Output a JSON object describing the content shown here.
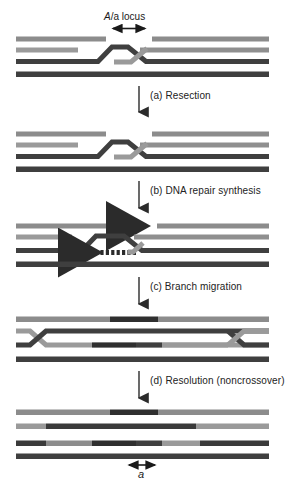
{
  "figure": {
    "title_label": "A/a locus",
    "title_label_italic_part": "A",
    "title_label_rest": "/a locus",
    "bottom_label": "a",
    "background_color": "#ffffff"
  },
  "colors": {
    "dark_strand": "#3a3a3a",
    "dark_strand_alt": "#4a4a4a",
    "light_strand": "#8c8c8c",
    "mid_strand": "#6e6e6e",
    "pale_strand": "#a8a8a8",
    "black": "#2b2b2b",
    "arrow": "#1a1a1a",
    "text": "#222222"
  },
  "steps": [
    {
      "id": "a",
      "label": "(a) Resection",
      "arrow_x": 139,
      "arrow_y": 92,
      "text_x": 150,
      "text_y": 95
    },
    {
      "id": "b",
      "label": "(b) DNA repair synthesis",
      "arrow_x": 139,
      "arrow_y": 187,
      "text_x": 150,
      "text_y": 190
    },
    {
      "id": "c",
      "label": "(c) Branch migration",
      "arrow_x": 139,
      "arrow_y": 283,
      "text_x": 150,
      "text_y": 286
    },
    {
      "id": "d",
      "label": "(d) Resolution (noncrossover)",
      "arrow_x": 139,
      "arrow_y": 377,
      "text_x": 150,
      "text_y": 380
    }
  ],
  "panels": [
    {
      "name": "panel-initial-heteroduplex",
      "index": 1,
      "description": "Two homologous duplexes with single-strand invasion forming a crossed junction at the A/a locus"
    },
    {
      "name": "panel-resection",
      "index": 2,
      "description": "After resection, gaps widened on invading strands flanking the junction"
    },
    {
      "name": "panel-repair-synthesis",
      "index": 3,
      "description": "DNA repair synthesis shown as dashed arrows extending 3-prime ends rightward on top strand and leftward on third strand"
    },
    {
      "name": "panel-branch-migration",
      "index": 4,
      "description": "Branch migration moves the two Holliday junctions apart to the far left and far right, extending the heteroduplex region"
    },
    {
      "name": "panel-resolution",
      "index": 5,
      "description": "Resolution in the noncrossover orientation yields four linear strands with patched heteroduplex segments"
    }
  ],
  "annotations": {
    "locus_arrow": {
      "x1": 112,
      "x2": 146,
      "y": 28,
      "double_headed": true
    },
    "allele_arrow": {
      "x1": 128,
      "x2": 156,
      "y": 461,
      "double_headed": true
    },
    "synthesis_arrows": [
      {
        "name": "top-synthesis-arrow",
        "direction": "right",
        "x_start": 110,
        "x_end": 152,
        "y": 226
      },
      {
        "name": "bottom-synthesis-arrow",
        "direction": "left",
        "x_start": 138,
        "x_end": 94,
        "y": 253
      }
    ]
  }
}
